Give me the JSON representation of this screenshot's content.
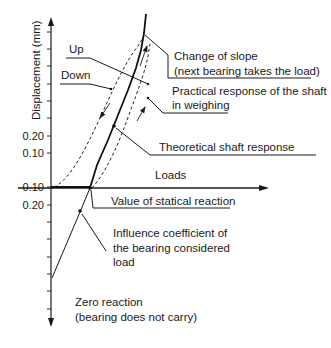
{
  "figure": {
    "y_axis_label": "Displacement (mm)",
    "x_axis_label": "Loads",
    "y_ticks_positive": [
      "0.20",
      "0.10"
    ],
    "y_ticks_negative": [
      "0.10",
      "0.20"
    ],
    "curve_labels": {
      "up": "Up",
      "down": "Down"
    },
    "annotations": {
      "change_of_slope_line1": "Change of slope",
      "change_of_slope_line2": "(next bearing takes the load)",
      "practical_line1": "Practical response of the shaft",
      "practical_line2": "in weighing",
      "theoretical": "Theoretical shaft response",
      "statical_reaction": "Value of statical reaction",
      "influence_line1": "Influence coefficient of",
      "influence_line2": "the bearing considered",
      "influence_line3": "load",
      "zero_reaction_line1": "Zero reaction",
      "zero_reaction_line2": "(bearing does not carry)"
    },
    "colors": {
      "ink": "#1a1a1a",
      "background": "#ffffff"
    }
  }
}
